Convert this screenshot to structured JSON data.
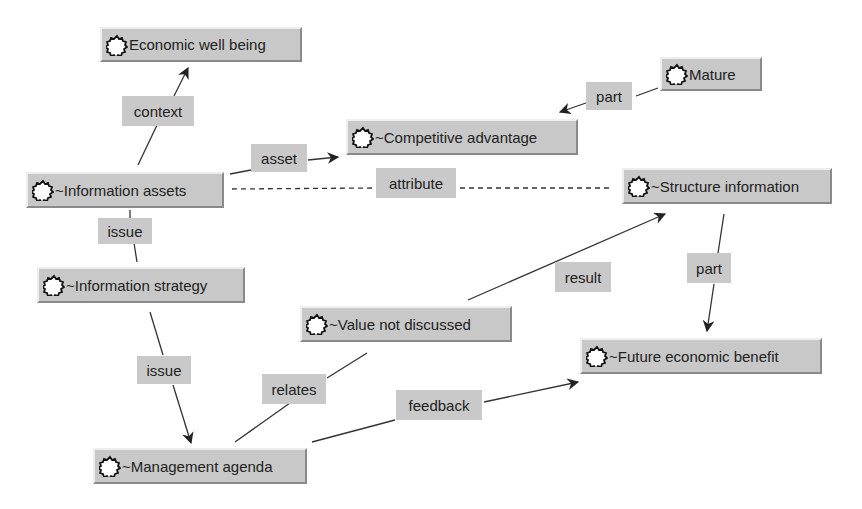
{
  "diagram": {
    "type": "concept-map",
    "colors": {
      "node_bg": "#c8c8c8",
      "label_bg": "#c9c9c9",
      "edge": "#333333",
      "background": "#ffffff"
    },
    "nodes": [
      {
        "id": "economic",
        "label": "Economic well being",
        "icon": "concept-gear-icon"
      },
      {
        "id": "mature",
        "label": "Mature",
        "icon": "concept-gear-icon"
      },
      {
        "id": "competitive",
        "label": "~Competitive advantage",
        "icon": "concept-gear-icon"
      },
      {
        "id": "infoassets",
        "label": "~Information assets",
        "icon": "concept-gear-icon"
      },
      {
        "id": "structure",
        "label": "~Structure information",
        "icon": "concept-gear-icon"
      },
      {
        "id": "infostrategy",
        "label": "~Information strategy",
        "icon": "concept-gear-icon"
      },
      {
        "id": "value",
        "label": "~Value not discussed",
        "icon": "concept-gear-icon"
      },
      {
        "id": "future",
        "label": "~Future economic benefit",
        "icon": "concept-gear-icon"
      },
      {
        "id": "management",
        "label": "~Management agenda",
        "icon": "concept-gear-icon"
      }
    ],
    "edges": [
      {
        "label": "context",
        "from": "~Information assets",
        "to": "Economic well being",
        "style": "solid",
        "arrow": true
      },
      {
        "label": "part",
        "from": "Mature",
        "to": "~Competitive advantage",
        "style": "solid",
        "arrow": true
      },
      {
        "label": "asset",
        "from": "~Information assets",
        "to": "~Competitive advantage",
        "style": "solid",
        "arrow": true
      },
      {
        "label": "attribute",
        "from": "~Information assets",
        "to": "~Structure information",
        "style": "dashed",
        "arrow": false
      },
      {
        "label": "issue",
        "from": "~Information assets",
        "to": "~Information strategy",
        "style": "solid",
        "arrow": false
      },
      {
        "label": "result",
        "from": "~Value not discussed",
        "to": "~Structure information",
        "style": "solid",
        "arrow": true
      },
      {
        "label": "part",
        "from": "~Structure information",
        "to": "~Future economic benefit",
        "style": "solid",
        "arrow": true
      },
      {
        "label": "issue",
        "from": "~Information strategy",
        "to": "~Management agenda",
        "style": "solid",
        "arrow": true
      },
      {
        "label": "relates",
        "from": "~Management agenda",
        "to": "~Value not discussed",
        "style": "solid",
        "arrow": false
      },
      {
        "label": "feedback",
        "from": "~Management agenda",
        "to": "~Future economic benefit",
        "style": "solid",
        "arrow": true
      }
    ]
  }
}
